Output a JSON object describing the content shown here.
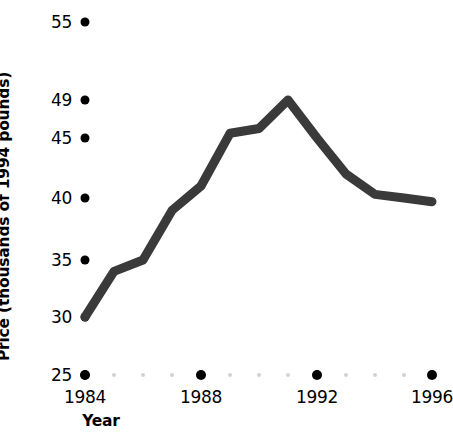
{
  "chart_data": {
    "type": "line",
    "title": "",
    "xlabel": "Year",
    "ylabel": "Price (thousands of 1994 pounds)",
    "x": [
      1984,
      1985,
      1986,
      1987,
      1988,
      1989,
      1990,
      1991,
      1992,
      1993,
      1994,
      1995,
      1996
    ],
    "values": [
      30.0,
      34.0,
      35.0,
      39.0,
      41.0,
      45.5,
      46.0,
      49.0,
      45.0,
      42.0,
      40.3,
      40.0,
      39.7
    ],
    "series": [
      {
        "name": "Price",
        "values": [
          30.0,
          34.0,
          35.0,
          39.0,
          41.0,
          45.5,
          46.0,
          49.0,
          45.0,
          42.0,
          40.3,
          40.0,
          39.7
        ]
      }
    ],
    "xlim": [
      1984,
      1996
    ],
    "ylim": [
      25,
      55
    ],
    "grid": false,
    "legend": false,
    "legend_position": "none",
    "line_color": "#3a3a3a",
    "line_width": 9,
    "y_ticks": [
      {
        "label": "55",
        "value": 55,
        "py": 22
      },
      {
        "label": "49",
        "value": 49,
        "py": 100
      },
      {
        "label": "45",
        "value": 45,
        "py": 138
      },
      {
        "label": "40",
        "value": 40,
        "py": 198
      },
      {
        "label": "35",
        "value": 35,
        "py": 260
      },
      {
        "label": "30",
        "value": 30,
        "py": 317
      },
      {
        "label": "25",
        "value": 25,
        "py": 375
      }
    ],
    "x_ticks": [
      {
        "label": "1984",
        "value": 1984,
        "px": 85,
        "major": true
      },
      {
        "label": "",
        "value": 1985,
        "px": 114,
        "major": false
      },
      {
        "label": "",
        "value": 1986,
        "px": 143,
        "major": false
      },
      {
        "label": "",
        "value": 1987,
        "px": 172,
        "major": false
      },
      {
        "label": "1988",
        "value": 1988,
        "px": 201,
        "major": true
      },
      {
        "label": "",
        "value": 1989,
        "px": 230,
        "major": false
      },
      {
        "label": "",
        "value": 1990,
        "px": 259,
        "major": false
      },
      {
        "label": "",
        "value": 1991,
        "px": 288,
        "major": false
      },
      {
        "label": "1992",
        "value": 1992,
        "px": 317,
        "major": true
      },
      {
        "label": "",
        "value": 1993,
        "px": 346,
        "major": false
      },
      {
        "label": "",
        "value": 1994,
        "px": 375,
        "major": false
      },
      {
        "label": "",
        "value": 1995,
        "px": 404,
        "major": false
      },
      {
        "label": "1996",
        "value": 1996,
        "px": 432,
        "major": true
      }
    ],
    "axis_dot_color_major": "#000000",
    "axis_dot_color_minor": "#d2d2d2"
  }
}
